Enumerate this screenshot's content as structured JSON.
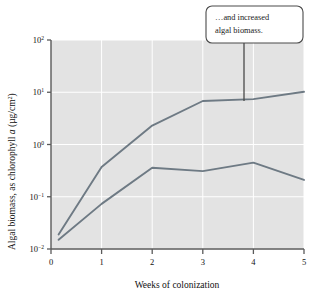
{
  "figure": {
    "background_color": "#ffffff",
    "plot_background_color": "#e3e3e3",
    "gridline_color": "#ffffff",
    "axis_color": "#5a5a5a",
    "series_color": "#6e7a84"
  },
  "callout": {
    "line1": "…and increased",
    "line2": "algal biomass.",
    "border_color": "#4a4a4a",
    "fill_color": "#ffffff"
  },
  "axes": {
    "y_title_part1": "Algal biomass, as chlorophyll ",
    "y_title_italic": "a",
    "y_title_part2": " (µg/cm",
    "y_title_sup": "2",
    "y_title_part3": ")",
    "x_title": "Weeks of colonization",
    "y_ticks": [
      {
        "mantissa": "10",
        "exponent": "2",
        "value": 100
      },
      {
        "mantissa": "10",
        "exponent": "1",
        "value": 10
      },
      {
        "mantissa": "10",
        "exponent": "0",
        "value": 1
      },
      {
        "mantissa": "10",
        "exponent": "−1",
        "value": 0.1
      },
      {
        "mantissa": "10",
        "exponent": "−2",
        "value": 0.01
      }
    ],
    "x_ticks": [
      "0",
      "1",
      "2",
      "3",
      "4",
      "5"
    ]
  },
  "chart_data": {
    "type": "line",
    "title": "",
    "xlabel": "Weeks of colonization",
    "ylabel": "Algal biomass, as chlorophyll a (µg/cm²)",
    "xlim": [
      0,
      5
    ],
    "ylim": [
      0.01,
      100
    ],
    "yscale": "log",
    "xscale": "linear",
    "grid": true,
    "legend": "none",
    "annotations": [
      {
        "text": "…and increased algal biomass.",
        "points_to_x": 3.8,
        "points_to_y": 7.4
      }
    ],
    "series": [
      {
        "name": "upper-curve",
        "x": [
          0.15,
          1.0,
          2.0,
          3.0,
          4.0,
          5.0
        ],
        "y": [
          0.019,
          0.37,
          2.3,
          6.8,
          7.4,
          10.2
        ]
      },
      {
        "name": "lower-curve",
        "x": [
          0.15,
          1.0,
          2.0,
          3.0,
          4.0,
          5.0
        ],
        "y": [
          0.015,
          0.073,
          0.36,
          0.31,
          0.45,
          0.21
        ]
      }
    ]
  }
}
